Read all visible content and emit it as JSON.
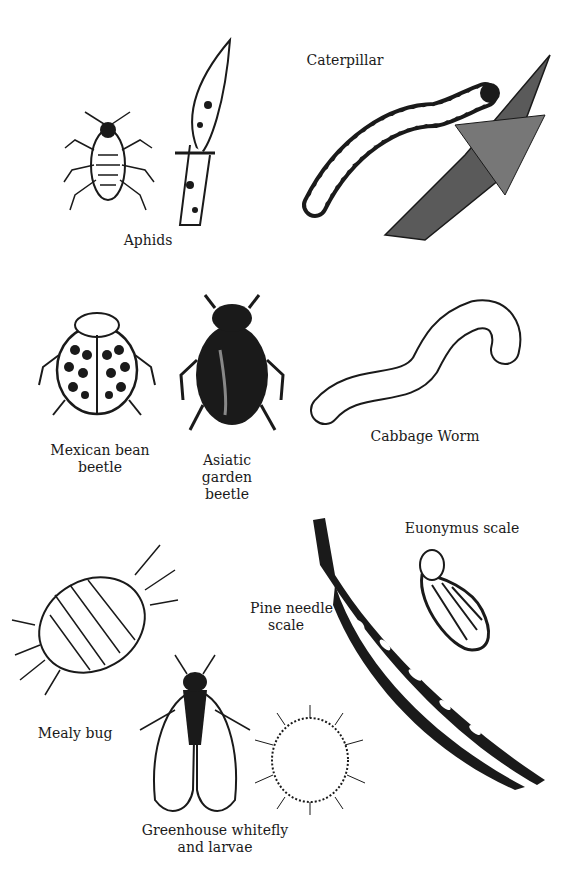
{
  "page": {
    "background": "#ffffff",
    "ink": "#1a1a1a"
  },
  "labels": {
    "aphids": "Aphids",
    "caterpillar": "Caterpillar",
    "mexican_bean_beetle_1": "Mexican bean",
    "mexican_bean_beetle_2": "beetle",
    "asiatic_1": "Asiatic",
    "asiatic_2": "garden",
    "asiatic_3": "beetle",
    "cabbage_worm": "Cabbage Worm",
    "euonymus_scale": "Euonymus scale",
    "pine_needle_1": "Pine needle",
    "pine_needle_2": "scale",
    "mealy_bug": "Mealy bug",
    "whitefly_1": "Greenhouse whitefly",
    "whitefly_2": "and larvae"
  }
}
